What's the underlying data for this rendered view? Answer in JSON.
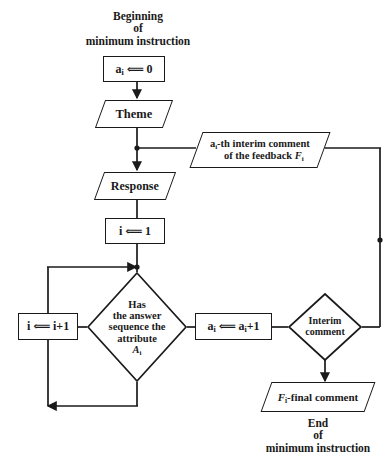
{
  "diagram": {
    "type": "flowchart",
    "title_caption": "Beginning\nof\nminimum instruction",
    "end_caption": "End\nof\nminimum instruction",
    "stroke_color": "#1a1a1a",
    "background_color": "#ffffff",
    "nodes": {
      "init_a": {
        "label": "aᵢ ⟸ 0",
        "shape": "process"
      },
      "theme": {
        "label": "Theme",
        "shape": "input-output"
      },
      "feedback": {
        "label": "aᵢ-th interim comment\nof the feedback Fᵢ",
        "shape": "input-output"
      },
      "response": {
        "label": "Response",
        "shape": "input-output"
      },
      "init_i": {
        "label": "i ⟸ 1",
        "shape": "process"
      },
      "decision_attribute": {
        "label": "Has\nthe answer\nsequence the\nattribute\nAᵢ",
        "shape": "decision"
      },
      "incr_i": {
        "label": "i ⟸ i+1",
        "shape": "process"
      },
      "incr_a": {
        "label": "aᵢ ⟸ aᵢ+1",
        "shape": "process"
      },
      "decision_interim": {
        "label": "Interim\ncomment",
        "shape": "decision"
      },
      "final_comment": {
        "label": "Fᵢ-final comment",
        "shape": "input-output"
      }
    },
    "edges": [
      {
        "from": "init_a",
        "to": "theme"
      },
      {
        "from": "theme",
        "to": "response"
      },
      {
        "from": "feedback",
        "to": "theme-response-junction"
      },
      {
        "from": "response",
        "to": "init_i"
      },
      {
        "from": "init_i",
        "to": "decision_attribute"
      },
      {
        "from": "decision_attribute",
        "to": "incr_a"
      },
      {
        "from": "decision_attribute",
        "to": "incr_i"
      },
      {
        "from": "incr_i",
        "to": "decision_attribute-junction"
      },
      {
        "from": "incr_a",
        "to": "decision_interim"
      },
      {
        "from": "decision_interim",
        "to": "feedback"
      },
      {
        "from": "decision_interim",
        "to": "final_comment"
      }
    ]
  }
}
